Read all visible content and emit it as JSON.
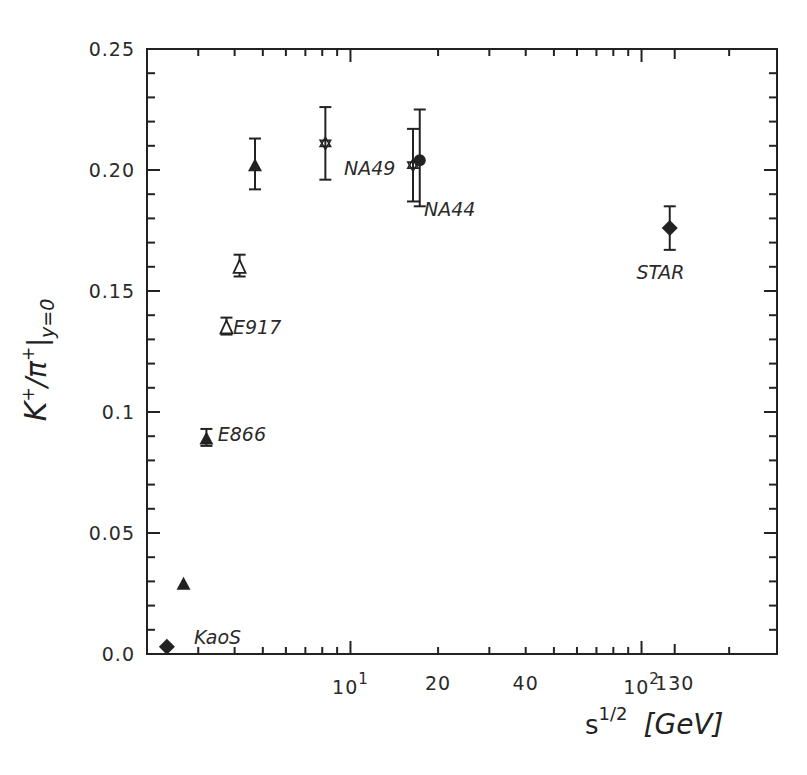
{
  "chart_data": {
    "type": "scatter",
    "title": "",
    "xlabel": "s^{1/2} [GeV]",
    "ylabel": "K+/π+ |y=0",
    "xscale": "log",
    "xlim": [
      2.0,
      292
    ],
    "ylim": [
      0.0,
      0.25
    ],
    "grid": false,
    "legend": "none (inline text labels)",
    "x_tick_labels": [
      {
        "value": 10,
        "label": "10",
        "sup": "1"
      },
      {
        "value": 20,
        "label": "20"
      },
      {
        "value": 40,
        "label": "40"
      },
      {
        "value": 100,
        "label": "10",
        "sup": "2"
      },
      {
        "value": 130,
        "label": "130"
      }
    ],
    "y_tick_labels": [
      {
        "value": 0.0,
        "label": "0.0"
      },
      {
        "value": 0.05,
        "label": "0.05"
      },
      {
        "value": 0.1,
        "label": "0.1"
      },
      {
        "value": 0.15,
        "label": "0.15"
      },
      {
        "value": 0.2,
        "label": "0.20"
      },
      {
        "value": 0.25,
        "label": "0.25"
      }
    ],
    "series": [
      {
        "name": "KaoS",
        "marker": "diamond-filled",
        "points": [
          {
            "x": 2.34,
            "y": 0.003
          }
        ]
      },
      {
        "name": "E866",
        "marker": "triangle-filled",
        "points": [
          {
            "x": 2.67,
            "y": 0.029
          },
          {
            "x": 3.2,
            "y": 0.089,
            "ylo": 0.086,
            "yhi": 0.093
          },
          {
            "x": 4.7,
            "y": 0.202,
            "ylo": 0.192,
            "yhi": 0.213
          }
        ]
      },
      {
        "name": "E917",
        "marker": "triangle-open",
        "points": [
          {
            "x": 3.75,
            "y": 0.135,
            "ylo": 0.132,
            "yhi": 0.139
          },
          {
            "x": 4.16,
            "y": 0.16,
            "ylo": 0.156,
            "yhi": 0.165
          }
        ]
      },
      {
        "name": "NA49",
        "marker": "star-open",
        "points": [
          {
            "x": 8.2,
            "y": 0.211,
            "ylo": 0.196,
            "yhi": 0.226
          },
          {
            "x": 16.4,
            "y": 0.202,
            "ylo": 0.187,
            "yhi": 0.217
          }
        ]
      },
      {
        "name": "NA44",
        "marker": "circle-filled",
        "points": [
          {
            "x": 17.3,
            "y": 0.204,
            "ylo": 0.185,
            "yhi": 0.225
          }
        ]
      },
      {
        "name": "STAR",
        "marker": "diamond-filled",
        "points": [
          {
            "x": 125,
            "y": 0.176,
            "ylo": 0.167,
            "yhi": 0.185
          }
        ]
      }
    ],
    "annotations": [
      {
        "text": "KaoS",
        "x": 2.9,
        "y": 0.007
      },
      {
        "text": "E866",
        "x": 3.5,
        "y": 0.091
      },
      {
        "text": "E917",
        "x": 3.95,
        "y": 0.135
      },
      {
        "text": "NA49",
        "x": 9.5,
        "y": 0.201
      },
      {
        "text": "NA44",
        "x": 17.9,
        "y": 0.184
      },
      {
        "text": "STAR",
        "x": 96,
        "y": 0.158
      }
    ]
  },
  "labels": {
    "y_axis_main": "K",
    "y_axis_sup1": "+",
    "y_axis_slash": "/π",
    "y_axis_sup2": "+",
    "y_axis_sub": "y=0",
    "x_axis_main": "s",
    "x_axis_sup": "1/2",
    "x_axis_unit": "[GeV]"
  },
  "colors": {
    "ink": "#222222",
    "background": "#ffffff"
  }
}
